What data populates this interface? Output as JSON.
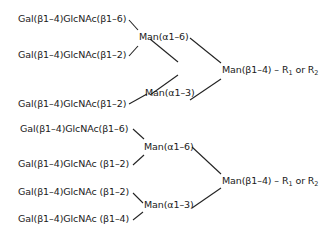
{
  "diagram": {
    "type": "glycan-structure",
    "structures": [
      {
        "id": "biantennary",
        "branches": [
          {
            "label": "Gal(β1–4)GlcNAc(β1–6)"
          },
          {
            "label": "Gal(β1–4)GlcNAc(β1–2)"
          },
          {
            "label": "Gal(β1–4)GlcNAc(β1–2)"
          }
        ],
        "mannose_upper": "Man(α1–6)",
        "mannose_lower": "Man(α1–3)",
        "core": {
          "prefix": "Man(β1–4) – R",
          "sub1": "1",
          "or": " or R",
          "sub2": "2"
        }
      },
      {
        "id": "tetraantennary",
        "branches": [
          {
            "label": "Gal(β1–4)GlcNAc(β1–6)"
          },
          {
            "label": "Gal(β1–4)GlcNAc (β1–2)"
          },
          {
            "label": "Gal(β1–4)GlcNAc (β1–2)"
          },
          {
            "label": "Gal(β1–4)GlcNAc (β1–4)"
          }
        ],
        "mannose_upper": "Man(α1–6)",
        "mannose_lower": "Man(α1–3)",
        "core": {
          "prefix": "Man(β1–4) – R",
          "sub1": "1",
          "or": " or R",
          "sub2": "2"
        }
      }
    ]
  }
}
